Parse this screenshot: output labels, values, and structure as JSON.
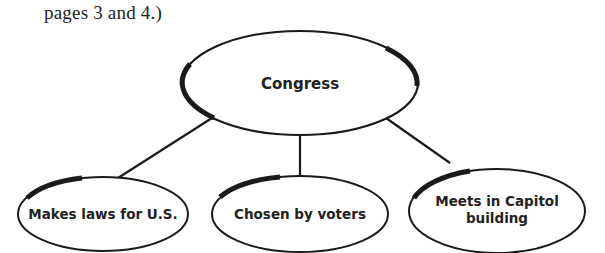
{
  "caption": "pages 3 and 4.)",
  "diagram": {
    "type": "concept-web",
    "center": {
      "label": "Congress"
    },
    "details": [
      {
        "lines": [
          "Makes laws for U.S."
        ]
      },
      {
        "lines": [
          "Chosen by voters"
        ]
      },
      {
        "lines": [
          "Meets in Capitol",
          "building"
        ]
      }
    ],
    "colors": {
      "stroke": "#1a1a1a",
      "fill": "#ffffff",
      "text": "#222222"
    }
  }
}
